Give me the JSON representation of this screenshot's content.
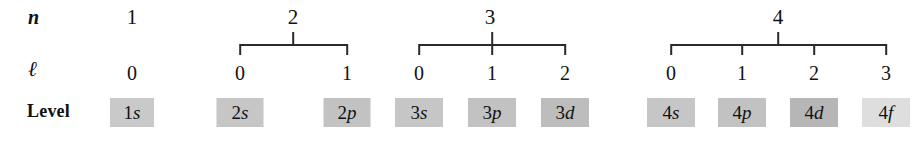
{
  "figure": {
    "row_labels": {
      "n": "n",
      "l": "ℓ",
      "level": "Level"
    }
  },
  "chart_data": {
    "type": "diagram",
    "title": "",
    "row_headers": [
      "n",
      "ℓ",
      "Level"
    ],
    "groups": [
      {
        "n": "1",
        "n_x": 132,
        "has_bracket": false,
        "bracket_left": 132,
        "bracket_right": 132,
        "columns": [
          {
            "l": "0",
            "level_prefix": "1",
            "level_letter": "s",
            "x": 132,
            "box_width": 44,
            "box_color": "#c9c9c9"
          }
        ]
      },
      {
        "n": "2",
        "n_x": 293,
        "has_bracket": true,
        "bracket_left": 240,
        "bracket_right": 347,
        "columns": [
          {
            "l": "0",
            "level_prefix": "2",
            "level_letter": "s",
            "x": 240,
            "box_width": 47,
            "box_color": "#c6c6c6"
          },
          {
            "l": "1",
            "level_prefix": "2",
            "level_letter": "p",
            "x": 347,
            "box_width": 47,
            "box_color": "#c2c2c2"
          }
        ]
      },
      {
        "n": "3",
        "n_x": 490,
        "has_bracket": true,
        "bracket_left": 419,
        "bracket_right": 565,
        "columns": [
          {
            "l": "0",
            "level_prefix": "3",
            "level_letter": "s",
            "x": 419,
            "box_width": 48,
            "box_color": "#c6c6c6"
          },
          {
            "l": "1",
            "level_prefix": "3",
            "level_letter": "p",
            "x": 492,
            "box_width": 48,
            "box_color": "#c2c2c2"
          },
          {
            "l": "2",
            "level_prefix": "3",
            "level_letter": "d",
            "x": 565,
            "box_width": 48,
            "box_color": "#bdbdbd"
          }
        ]
      },
      {
        "n": "4",
        "n_x": 778,
        "has_bracket": true,
        "bracket_left": 671,
        "bracket_right": 886,
        "columns": [
          {
            "l": "0",
            "level_prefix": "4",
            "level_letter": "s",
            "x": 671,
            "box_width": 48,
            "box_color": "#c6c6c6"
          },
          {
            "l": "1",
            "level_prefix": "4",
            "level_letter": "p",
            "x": 742,
            "box_width": 48,
            "box_color": "#c2c2c2"
          },
          {
            "l": "2",
            "level_prefix": "4",
            "level_letter": "d",
            "x": 814,
            "box_width": 48,
            "box_color": "#b6b6b6"
          },
          {
            "l": "3",
            "level_prefix": "4",
            "level_letter": "f",
            "x": 886,
            "box_width": 48,
            "box_color": "#dedede"
          }
        ]
      }
    ]
  }
}
